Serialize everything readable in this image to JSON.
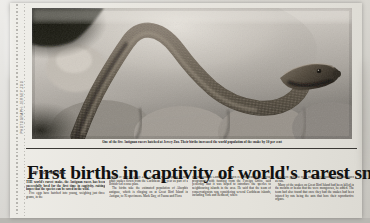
{
  "clipping": {
    "publication_type": "newspaper",
    "photo_credit": "PHOTOGRAPH: JERSEY ZOO",
    "caption": "One of the five Antiguan racers hatched at Jersey Zoo. Their births increased the world population of the snake by 10 per cent",
    "headline": "First births in captivity of world's rarest snake",
    "byline": "By Nick Nuttall",
    "columns": [
      {
        "paragraphs": [
          "THE world's rarest snake, the Antiguan racer, has been successfully bred for the first time in captivity, raising hopes that the species can be saved in the wild.",
          "Five eggs have hatched into young, weighing just three grams, in the"
        ]
      },
      {
        "paragraphs": [
          "delight of staff at Jersey Zoo. They are the offspring of four adult snakes flown from the Caribbean last year as part of a British-led rescue plan.",
          "The births take the estimated population of Alsophis antiguae, which is clinging on at Great Bird Island in Antigua, to 95 specimens. Mark Day, of Fauna and Flora"
        ]
      },
      {
        "paragraphs": [
          "International in Cambridge, which is orchestrating the rescue programme with funding from the Foreign Office, said yesterday that it was hoped to introduce the species to neighbouring islands in the area. He said that the team of conservationists was considering several Caribbean islands, including York and Redhead, where"
        ]
      },
      {
        "paragraphs": [
          "there were plans to clear non-native plants and animals such as rats.",
          "Many of the snakes on Great Bird Island had been killed in the mouths or beaks that the were mongooses, he added. The team had also found that once they had the snakes had been injured by rats being the ants that bore their reproductive organs."
        ]
      }
    ]
  }
}
